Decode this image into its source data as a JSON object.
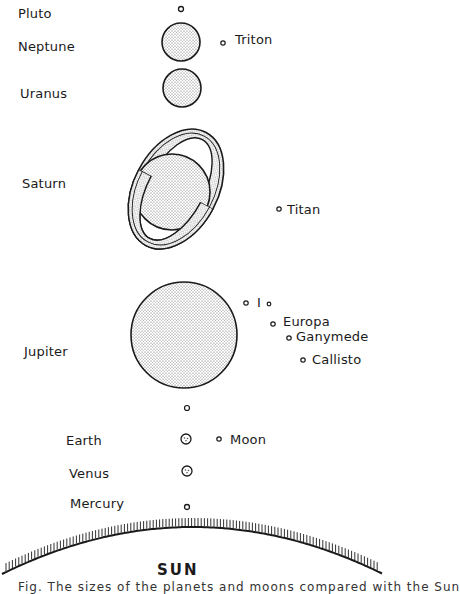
{
  "planets": [
    {
      "name": "Pluto",
      "label_x": 18,
      "label_y": 7,
      "cx": 181,
      "cy": 9,
      "r": 2.5,
      "fill": "none"
    },
    {
      "name": "Neptune",
      "label_x": 18,
      "label_y": 40,
      "cx": 181,
      "cy": 42,
      "r": 19,
      "fill": "dots"
    },
    {
      "name": "Uranus",
      "label_x": 20,
      "label_y": 87,
      "cx": 182,
      "cy": 88,
      "r": 19,
      "fill": "dots"
    },
    {
      "name": "Saturn",
      "label_x": 22,
      "label_y": 177,
      "cx": 172,
      "cy": 192,
      "r": 38,
      "fill": "dots"
    },
    {
      "name": "Jupiter",
      "label_x": 24,
      "label_y": 345,
      "cx": 184,
      "cy": 335,
      "r": 53,
      "fill": "dots"
    },
    {
      "name": "Earth",
      "label_x": 66,
      "label_y": 434,
      "cx": 186,
      "cy": 439,
      "r": 5,
      "fill": "spots"
    },
    {
      "name": "Venus",
      "label_x": 69,
      "label_y": 467,
      "cx": 187,
      "cy": 471,
      "r": 5,
      "fill": "spots"
    },
    {
      "name": "Mercury",
      "label_x": 70,
      "label_y": 497,
      "cx": 187,
      "cy": 507,
      "r": 2.5,
      "fill": "none"
    }
  ],
  "moons": [
    {
      "name": "Triton",
      "cx": 223,
      "cy": 43,
      "label_x": 235,
      "label_y": 33
    },
    {
      "name": "Titan",
      "cx": 279,
      "cy": 209,
      "label_x": 287,
      "label_y": 203
    },
    {
      "name": "I",
      "cx": 246,
      "cy": 303,
      "label_x": 257,
      "label_y": 296
    },
    {
      "name": "Europa",
      "cx": 273,
      "cy": 324,
      "label_x": 283,
      "label_y": 315
    },
    {
      "name": "Ganymede",
      "cx": 289,
      "cy": 338,
      "label_x": 296,
      "label_y": 330
    },
    {
      "name": "Callisto",
      "cx": 303,
      "cy": 360,
      "label_x": 312,
      "label_y": 353
    },
    {
      "name": "Moon",
      "cx": 219,
      "cy": 439,
      "label_x": 230,
      "label_y": 433
    }
  ],
  "extra_dots": [
    {
      "cx": 269,
      "cy": 304,
      "r": 1.8,
      "note": "dot after Io label"
    },
    {
      "cx": 187,
      "cy": 408,
      "r": 2.5,
      "note": "unlabeled body between Jupiter and Earth"
    }
  ],
  "saturn_rings": {
    "cx": 176,
    "cy": 189,
    "outer_rx": 42,
    "outer_ry": 128,
    "inner_rx": 28,
    "inner_ry": 112,
    "rotate": 28
  },
  "sun": {
    "label": "SUN",
    "label_x": 157,
    "label_y": 563,
    "arc_left_y": 575,
    "arc_peak_y": 527,
    "arc_right_y": 575
  },
  "caption": {
    "text": "Fig. The sizes of the planets and moons compared with the Sun"
  },
  "colors": {
    "ink": "#1a1a1a",
    "dot_fill": "#555555",
    "background": "#ffffff"
  }
}
